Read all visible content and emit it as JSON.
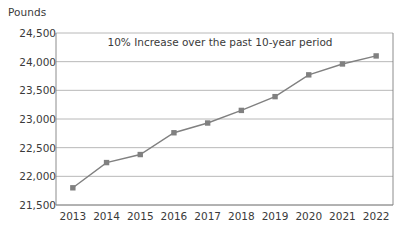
{
  "chart_data": {
    "type": "line",
    "title": "",
    "annotation": "10% Increase over the past 10-year period",
    "xlabel": "",
    "ylabel": "Pounds",
    "categories": [
      "2013",
      "2014",
      "2015",
      "2016",
      "2017",
      "2018",
      "2019",
      "2020",
      "2021",
      "2022"
    ],
    "values": [
      21800,
      22240,
      22380,
      22760,
      22930,
      23150,
      23390,
      23770,
      23960,
      24100
    ],
    "ylim": [
      21500,
      24500
    ],
    "ytick_values": [
      21500,
      22000,
      22500,
      23000,
      23500,
      24000,
      24500
    ],
    "ytick_labels": [
      "21,500",
      "22,000",
      "22,500",
      "23,000",
      "23,500",
      "24,000",
      "24,500"
    ],
    "grid": true,
    "legend": false,
    "series": [
      {
        "name": "Pounds",
        "values": [
          21800,
          22240,
          22380,
          22760,
          22930,
          23150,
          23390,
          23770,
          23960,
          24100
        ],
        "line_color": "#808080",
        "marker_color": "#808080",
        "marker": "square"
      }
    ],
    "colors": {
      "line": "#808080",
      "marker": "#808080",
      "grid": "#a6a6a6",
      "axis": "#808080",
      "text": "#3a3a3a",
      "background": "#ffffff"
    }
  }
}
